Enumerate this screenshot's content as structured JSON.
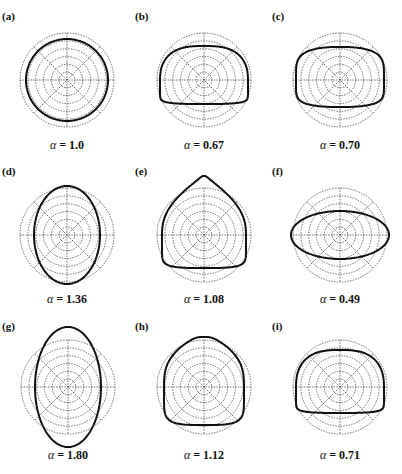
{
  "figure": {
    "grid": {
      "rings": 6,
      "outer_radius": 47,
      "spokes_deg": [
        0,
        45,
        90,
        135
      ],
      "line_color": "#333333",
      "curve_color": "#111111"
    },
    "panels": [
      {
        "label": "(a)",
        "alpha_symbol": "α",
        "alpha_text": "= 1.0",
        "alpha": 1.0,
        "shape": "circle",
        "cx": 67,
        "cy": 80,
        "params": {
          "rx": 41,
          "ry": 41
        }
      },
      {
        "label": "(b)",
        "alpha_symbol": "α",
        "alpha_text": "= 0.67",
        "alpha": 0.67,
        "shape": "dome",
        "cx": 204,
        "cy": 80,
        "params": {
          "rx": 44,
          "top": 34,
          "bottom": 24
        }
      },
      {
        "label": "(c)",
        "alpha_symbol": "α",
        "alpha_text": "= 0.70",
        "alpha": 0.7,
        "shape": "lens",
        "cx": 340,
        "cy": 80,
        "params": {
          "rx": 44,
          "top": 33,
          "bottom": 27
        }
      },
      {
        "label": "(d)",
        "alpha_symbol": "α",
        "alpha_text": "= 1.36",
        "alpha": 1.36,
        "shape": "ellipse",
        "cx": 67,
        "cy": 235,
        "params": {
          "rx": 33,
          "ry": 49
        }
      },
      {
        "label": "(e)",
        "alpha_symbol": "α",
        "alpha_text": "= 1.08",
        "alpha": 1.08,
        "shape": "triangle",
        "cx": 204,
        "cy": 235,
        "params": {
          "rx": 42,
          "top": 59,
          "bottom": 33
        }
      },
      {
        "label": "(f)",
        "alpha_symbol": "α",
        "alpha_text": "= 0.49",
        "alpha": 0.49,
        "shape": "ellipse",
        "cx": 340,
        "cy": 235,
        "params": {
          "rx": 49,
          "ry": 24
        }
      },
      {
        "label": "(g)",
        "alpha_symbol": "α",
        "alpha_text": "= 1.80",
        "alpha": 1.8,
        "shape": "ellipse",
        "cx": 68,
        "cy": 387,
        "params": {
          "rx": 33,
          "ry": 60
        }
      },
      {
        "label": "(h)",
        "alpha_symbol": "α",
        "alpha_text": "= 1.12",
        "alpha": 1.12,
        "shape": "teardrop",
        "cx": 204,
        "cy": 387,
        "params": {
          "rx": 40,
          "top": 50,
          "bottom": 38
        }
      },
      {
        "label": "(i)",
        "alpha_symbol": "α",
        "alpha_text": "= 0.71",
        "alpha": 0.71,
        "shape": "dome",
        "cx": 340,
        "cy": 387,
        "params": {
          "rx": 44,
          "top": 37,
          "bottom": 26
        }
      }
    ],
    "label_positions": [
      {
        "x": 2,
        "y": 10
      },
      {
        "x": 135,
        "y": 10
      },
      {
        "x": 272,
        "y": 10
      },
      {
        "x": 2,
        "y": 165
      },
      {
        "x": 135,
        "y": 165
      },
      {
        "x": 272,
        "y": 165
      },
      {
        "x": 2,
        "y": 320
      },
      {
        "x": 135,
        "y": 320
      },
      {
        "x": 272,
        "y": 320
      }
    ],
    "caption_y": [
      138,
      138,
      138,
      292,
      292,
      292,
      448,
      448,
      448
    ]
  }
}
